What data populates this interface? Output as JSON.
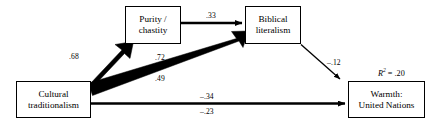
{
  "diagram": {
    "type": "path-diagram",
    "title": "",
    "background_color": "#ffffff",
    "line_color": "#000000",
    "nodes": [
      {
        "id": "cultural-traditionalism",
        "line1": "Cultural",
        "line2": "traditionalism",
        "x": 16,
        "y": 81,
        "w": 75,
        "h": 37
      },
      {
        "id": "purity-chastity",
        "line1": "Purity /",
        "line2": "chastity",
        "x": 125,
        "y": 6,
        "w": 56,
        "h": 38
      },
      {
        "id": "biblical-literalism",
        "line1": "Biblical",
        "line2": "literalism",
        "x": 245,
        "y": 6,
        "w": 56,
        "h": 38
      },
      {
        "id": "warmth-united-nations",
        "line1": "Warmth:",
        "line2": "United Nations",
        "x": 348,
        "y": 81,
        "w": 77,
        "h": 37
      }
    ],
    "edges": [
      {
        "id": "cultural-to-purity",
        "from": "cultural-traditionalism",
        "to": "purity-chastity",
        "label": ".68",
        "label_x": 69,
        "label_y": 52,
        "weight": "very-thick"
      },
      {
        "id": "purity-to-biblical",
        "from": "purity-chastity",
        "to": "biblical-literalism",
        "label": ".33",
        "label_x": 206,
        "label_y": 11,
        "weight": "medium"
      },
      {
        "id": "cultural-to-biblical-upper",
        "from": "cultural-traditionalism",
        "to": "biblical-literalism",
        "label": ".72",
        "label_x": 155,
        "label_y": 53,
        "weight": "very-thick"
      },
      {
        "id": "cultural-to-biblical-lower",
        "from": "cultural-traditionalism",
        "to": "biblical-literalism",
        "label": ".49",
        "label_x": 155,
        "label_y": 74,
        "weight": "very-thick"
      },
      {
        "id": "biblical-to-warmth",
        "from": "biblical-literalism",
        "to": "warmth-united-nations",
        "label": "–.12",
        "label_x": 327,
        "label_y": 58,
        "weight": "thin"
      },
      {
        "id": "cultural-to-warmth-upper",
        "from": "cultural-traditionalism",
        "to": "warmth-united-nations",
        "label": "–.34",
        "label_x": 200,
        "label_y": 92,
        "weight": "medium"
      },
      {
        "id": "cultural-to-warmth-lower",
        "from": "cultural-traditionalism",
        "to": "warmth-united-nations",
        "label": "–.23",
        "label_x": 200,
        "label_y": 107,
        "weight": "medium"
      }
    ],
    "statistics": [
      {
        "id": "r-squared-warmth",
        "symbol": "R",
        "exponent": "2",
        "equals": " = ",
        "value": ".20",
        "x": 378,
        "y": 67
      }
    ]
  }
}
